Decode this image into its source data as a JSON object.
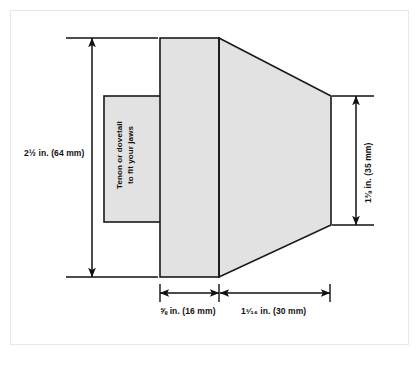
{
  "diagram": {
    "background_color": "#ffffff",
    "frame_border_color": "#e8e8e8",
    "shape_fill_color": "#e0e0e0",
    "shape_outline_color": "#1a1a1a",
    "dimension_line_color": "#111111"
  },
  "labels": {
    "height_left": "2½ in. (64 mm)",
    "height_right": "1⅜ in. (35 mm)",
    "width_flange": "⅝ in. (16 mm)",
    "width_taper": "1³⁄₁₆ in. (30 mm)",
    "tenon_line1": "Tenon or dovetail",
    "tenon_line2": "to fit your jaws"
  },
  "dimensions": [
    {
      "name": "overall-height",
      "label": "2½ in. (64 mm)",
      "value_in": "2 1/2",
      "value_mm": 64,
      "orientation": "vertical",
      "position": "left"
    },
    {
      "name": "small-end-height",
      "label": "1⅜ in. (35 mm)",
      "value_in": "1 3/8",
      "value_mm": 35,
      "orientation": "vertical",
      "position": "right"
    },
    {
      "name": "flange-width",
      "label": "⅝ in. (16 mm)",
      "value_in": "5/8",
      "value_mm": 16,
      "orientation": "horizontal",
      "position": "bottom-left"
    },
    {
      "name": "taper-width",
      "label": "1³⁄₁₆ in. (30 mm)",
      "value_in": "1 3/16",
      "value_mm": 30,
      "orientation": "horizontal",
      "position": "bottom-right"
    }
  ],
  "parts": [
    {
      "name": "tenon-block",
      "description": "Tenon or dovetail to fit your jaws",
      "shape": "rectangle"
    },
    {
      "name": "flange-block",
      "description": "Straight flange section",
      "shape": "rectangle"
    },
    {
      "name": "tapered-body",
      "description": "Tapered body section",
      "shape": "trapezoid"
    }
  ]
}
